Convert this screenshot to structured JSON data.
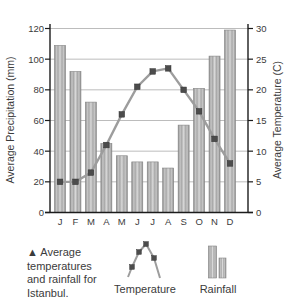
{
  "figure": {
    "caption": "▲ Average\ntemperatures\nand rainfall for\nIstanbul.",
    "legend": {
      "temperature_label": "Temperature",
      "rainfall_label": "Rainfall"
    }
  },
  "chart_data": {
    "type": "combo-bar-line-climograph",
    "categories": [
      "J",
      "F",
      "M",
      "A",
      "M",
      "J",
      "J",
      "A",
      "S",
      "O",
      "N",
      "D"
    ],
    "series": [
      {
        "name": "Rainfall",
        "type": "bar",
        "axis": "left",
        "unit": "mm",
        "values": [
          109,
          92,
          72,
          45,
          37,
          33,
          33,
          29,
          57,
          81,
          102,
          119
        ]
      },
      {
        "name": "Temperature",
        "type": "line",
        "axis": "right",
        "unit": "C",
        "values": [
          5,
          5,
          6.5,
          11,
          16,
          20.5,
          23,
          23.5,
          20,
          16.5,
          12,
          8
        ]
      }
    ],
    "left_axis": {
      "label": "Average Precipitation (mm)",
      "min": 0,
      "max": 120,
      "step": 20
    },
    "right_axis": {
      "label": "Average Temperature (C)",
      "min": 0,
      "max": 30,
      "step": 5
    },
    "grid": true,
    "legend_position": "bottom",
    "colors": {
      "bar_edge": "#8a8a8a",
      "bar_stripe_light": "#d8d8d8",
      "bar_stripe_mid": "#a9a9a9",
      "bar_stripe_soft": "#c6c6c6",
      "line": "#9d9d9d",
      "marker": "#4c4c4c",
      "grid": "#bcbcbc",
      "axis": "#1c1c1c",
      "text": "#3b3b3b"
    }
  }
}
